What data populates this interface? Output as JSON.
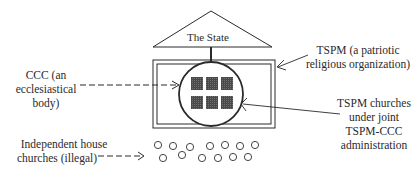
{
  "diagram": {
    "state_label": "The State",
    "labels": {
      "ccc": [
        "CCC (an",
        "ecclesiastical",
        "body)"
      ],
      "tspm": [
        "TSPM (a patriotic",
        "religious organization)"
      ],
      "churches": [
        "TSPM churches",
        "under joint",
        "TSPM-CCC",
        "administration"
      ],
      "house_churches": [
        "Independent house",
        "churches (illegal)"
      ]
    },
    "elements": {
      "state_shape": "triangle",
      "tspm_shape": "double-rectangle",
      "ccc_shape": "circle",
      "tspm_church_count": 6,
      "house_church_count": 13
    },
    "colors": {
      "line": "#2a2a2a",
      "church_fill": "#555555"
    }
  }
}
